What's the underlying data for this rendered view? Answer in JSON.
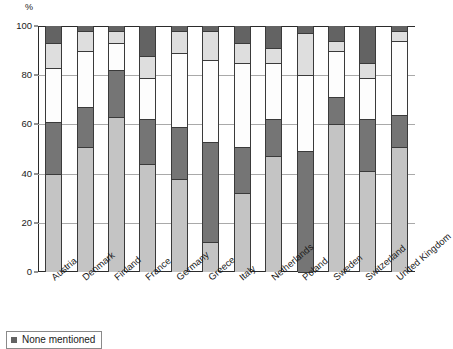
{
  "chart_data": {
    "type": "bar",
    "subtype": "stacked-100-percent-vertical",
    "title": "",
    "xlabel": "",
    "ylabel": "%",
    "ylim": [
      0,
      100
    ],
    "yticks": [
      0,
      20,
      40,
      60,
      80,
      100
    ],
    "ytick_labels": [
      "0",
      "20",
      "40",
      "60",
      "80",
      "100"
    ],
    "grid": true,
    "grid_axis": "y",
    "legend_position": "below-left",
    "categories": [
      "Austria",
      "Denmark",
      "Finland",
      "France",
      "Germany",
      "Greece",
      "Italy",
      "Netherlands",
      "Poland",
      "Sweden",
      "Switzerland",
      "United Kingdom"
    ],
    "series": [
      {
        "name": "Segment 1",
        "color": "#c4c4c4",
        "values": [
          40,
          51,
          63,
          44,
          38,
          12,
          32,
          47,
          0,
          60,
          41,
          51
        ]
      },
      {
        "name": "Segment 2",
        "color": "#757575",
        "values": [
          21,
          16,
          19,
          18,
          21,
          41,
          19,
          15,
          49,
          11,
          21,
          13
        ]
      },
      {
        "name": "Segment 3",
        "color": "#fdfdfd",
        "values": [
          22,
          23,
          11,
          17,
          30,
          33,
          34,
          23,
          31,
          19,
          17,
          30
        ]
      },
      {
        "name": "Segment 4",
        "color": "#dedede",
        "values": [
          10,
          8,
          5,
          9,
          9,
          12,
          8,
          6,
          17,
          4,
          6,
          4
        ]
      },
      {
        "name": "None mentioned",
        "color": "#636363",
        "values": [
          7,
          2,
          2,
          12,
          2,
          2,
          7,
          9,
          3,
          6,
          15,
          2
        ]
      }
    ]
  },
  "legend": {
    "entries": [
      {
        "label": "None mentioned",
        "color": "#636363"
      }
    ]
  },
  "axis": {
    "y_unit_label": "%"
  }
}
